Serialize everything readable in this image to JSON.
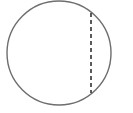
{
  "diagram": {
    "type": "geometry",
    "circle": {
      "cx": 59,
      "cy": 53,
      "r": 52,
      "stroke": "#6e6e6e",
      "stroke_width": 1.4,
      "fill": "#ffffff"
    },
    "chord": {
      "x1": 91,
      "y1": 13,
      "x2": 91,
      "y2": 93,
      "style": "dashed",
      "stroke": "#333333",
      "stroke_width": 1.6,
      "dash": "4,3"
    }
  }
}
